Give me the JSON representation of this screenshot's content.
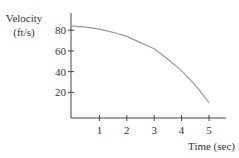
{
  "chart_data": {
    "type": "line",
    "title": "",
    "xlabel": "Time (sec)",
    "ylabel": "Velocity (ft/s)",
    "ylabel_lines": [
      "Velocity",
      "(ft/s)"
    ],
    "x_ticks": [
      1,
      2,
      3,
      4,
      5
    ],
    "y_ticks": [
      20,
      40,
      60,
      80
    ],
    "xlim": [
      0,
      5.5
    ],
    "ylim": [
      0,
      90
    ],
    "grid": false,
    "legend": null,
    "series": [
      {
        "name": "velocity",
        "x": [
          0,
          0.5,
          1,
          1.5,
          2,
          2.5,
          3,
          3.5,
          4,
          4.5,
          5
        ],
        "values": [
          84,
          83,
          81,
          78,
          74,
          68,
          62,
          52,
          41,
          27,
          10
        ]
      }
    ],
    "colors": {
      "axis": "#444444",
      "line": "#999999",
      "text": "#333333"
    }
  }
}
